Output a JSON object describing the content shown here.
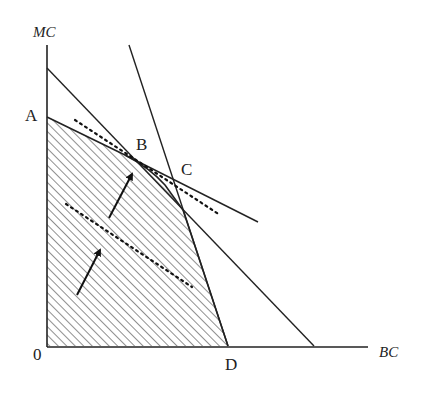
{
  "diagram": {
    "type": "production-possibility-frontier",
    "axes": {
      "y_label": "MC",
      "x_label": "BC",
      "origin_label": "0"
    },
    "points": {
      "A": "A",
      "B": "B",
      "C": "C",
      "D": "D"
    },
    "elements": [
      "shaded feasible region bounded by A-B-curve-D-0",
      "straight line from MC-axis intercept to BC-axis intercept beyond D",
      "steep straight line through C ending at D",
      "solid tangent line through B and C",
      "dotted tangent line near B",
      "dotted line inside shaded region",
      "two arrows pointing toward B"
    ],
    "colors": {
      "ink": "#222222",
      "background": "#ffffff"
    }
  }
}
